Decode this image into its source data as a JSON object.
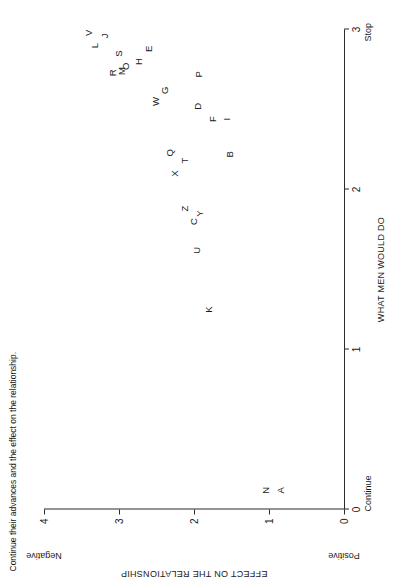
{
  "caption": "Continue their advances and the effect on the relationship.",
  "chart_data": {
    "type": "scatter",
    "title": "",
    "xlabel": "WHAT MEN WOULD DO",
    "ylabel": "EFFECT ON THE RELATIONSHIP",
    "xlim": [
      0,
      3
    ],
    "ylim": [
      0,
      4
    ],
    "xticks": [
      0,
      1,
      2,
      3
    ],
    "xticklabels": [
      "0",
      "1",
      "2",
      "3"
    ],
    "yticks": [
      0,
      1,
      2,
      3,
      4
    ],
    "yticklabels": [
      "0",
      "1",
      "2",
      "3",
      "4"
    ],
    "x_anchor_low": "Continue",
    "x_anchor_high": "Stop",
    "y_anchor_low": "Positive",
    "y_anchor_high": "Negative",
    "grid": false,
    "legend": "none",
    "point_label_mode": "letter",
    "points": [
      {
        "label": "A",
        "x": 0.12,
        "y": 0.85
      },
      {
        "label": "N",
        "x": 0.12,
        "y": 1.05
      },
      {
        "label": "K",
        "x": 1.25,
        "y": 1.82
      },
      {
        "label": "U",
        "x": 1.62,
        "y": 1.97
      },
      {
        "label": "C",
        "x": 1.8,
        "y": 2.02
      },
      {
        "label": "Y",
        "x": 1.85,
        "y": 1.93
      },
      {
        "label": "Z",
        "x": 1.88,
        "y": 2.13
      },
      {
        "label": "B",
        "x": 2.22,
        "y": 1.53
      },
      {
        "label": "X",
        "x": 2.1,
        "y": 2.27
      },
      {
        "label": "T",
        "x": 2.18,
        "y": 2.13
      },
      {
        "label": "Q",
        "x": 2.23,
        "y": 2.33
      },
      {
        "label": "I",
        "x": 2.44,
        "y": 1.57
      },
      {
        "label": "F",
        "x": 2.44,
        "y": 1.76
      },
      {
        "label": "D",
        "x": 2.52,
        "y": 1.96
      },
      {
        "label": "G",
        "x": 2.62,
        "y": 2.4
      },
      {
        "label": "W",
        "x": 2.55,
        "y": 2.52
      },
      {
        "label": "P",
        "x": 2.72,
        "y": 1.95
      },
      {
        "label": "E",
        "x": 2.88,
        "y": 2.62
      },
      {
        "label": "H",
        "x": 2.8,
        "y": 2.75
      },
      {
        "label": "O",
        "x": 2.77,
        "y": 2.92
      },
      {
        "label": "M",
        "x": 2.74,
        "y": 2.97
      },
      {
        "label": "S",
        "x": 2.85,
        "y": 3.02
      },
      {
        "label": "R",
        "x": 2.73,
        "y": 3.1
      },
      {
        "label": "J",
        "x": 2.96,
        "y": 3.2
      },
      {
        "label": "L",
        "x": 2.9,
        "y": 3.33
      },
      {
        "label": "V",
        "x": 2.98,
        "y": 3.42
      }
    ]
  }
}
